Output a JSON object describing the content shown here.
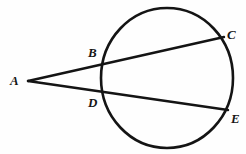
{
  "figure": {
    "background_color": "#fefefe",
    "stroke_color": "#141414",
    "label_color": "#151515",
    "labels": {
      "A": "A",
      "B": "B",
      "C": "C",
      "D": "D",
      "E": "E"
    },
    "points": {
      "A": {
        "x": 28,
        "y": 81
      },
      "B": {
        "x": 103,
        "y": 62
      },
      "C": {
        "x": 224,
        "y": 37
      },
      "D": {
        "x": 103,
        "y": 92
      },
      "E": {
        "x": 228,
        "y": 110
      }
    },
    "circle": {
      "cx": 167,
      "cy": 78,
      "rx": 66,
      "ry": 70,
      "stroke_width": 2.6
    },
    "segments": [
      {
        "name": "secant-A-B-C",
        "from": "A",
        "to": "C",
        "stroke_width": 2.4
      },
      {
        "name": "secant-A-D-E",
        "from": "A",
        "to": "E",
        "stroke_width": 2.4
      }
    ]
  }
}
